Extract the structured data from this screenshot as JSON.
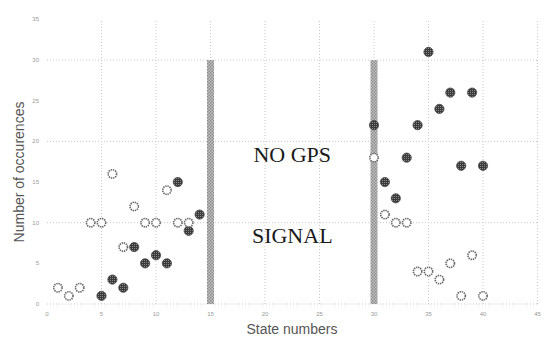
{
  "chart_data": {
    "type": "scatter",
    "title": "",
    "xlabel": "State numbers",
    "ylabel": "Number of occurences",
    "xlim": [
      0,
      45
    ],
    "ylim": [
      0,
      35
    ],
    "x_ticks": [
      0,
      5,
      10,
      15,
      20,
      25,
      30,
      35,
      40,
      45
    ],
    "y_ticks": [
      0,
      5,
      10,
      15,
      20,
      25,
      30,
      35
    ],
    "grid": true,
    "legend": null,
    "series": [
      {
        "name": "filled",
        "marker": "filled-circle",
        "color": "#555555",
        "points": [
          [
            5,
            1
          ],
          [
            6,
            3
          ],
          [
            7,
            2
          ],
          [
            8,
            7
          ],
          [
            9,
            5
          ],
          [
            10,
            6
          ],
          [
            11,
            5
          ],
          [
            12,
            15
          ],
          [
            13,
            9
          ],
          [
            14,
            11
          ],
          [
            30,
            22
          ],
          [
            31,
            15
          ],
          [
            32,
            13
          ],
          [
            33,
            18
          ],
          [
            34,
            22
          ],
          [
            35,
            31
          ],
          [
            36,
            24
          ],
          [
            37,
            26
          ],
          [
            38,
            17
          ],
          [
            39,
            26
          ],
          [
            40,
            17
          ]
        ]
      },
      {
        "name": "hollow",
        "marker": "open-circle",
        "color": "#666666",
        "points": [
          [
            1,
            2
          ],
          [
            2,
            1
          ],
          [
            3,
            2
          ],
          [
            4,
            10
          ],
          [
            5,
            10
          ],
          [
            6,
            16
          ],
          [
            7,
            7
          ],
          [
            8,
            12
          ],
          [
            9,
            10
          ],
          [
            10,
            10
          ],
          [
            11,
            14
          ],
          [
            12,
            10
          ],
          [
            13,
            10
          ],
          [
            30,
            18
          ],
          [
            31,
            11
          ],
          [
            32,
            10
          ],
          [
            33,
            10
          ],
          [
            34,
            4
          ],
          [
            35,
            4
          ],
          [
            36,
            3
          ],
          [
            37,
            5
          ],
          [
            38,
            1
          ],
          [
            39,
            6
          ],
          [
            40,
            1
          ]
        ]
      }
    ],
    "vertical_bars": [
      {
        "x": 15,
        "y_from": 0,
        "y_to": 30,
        "color": "#9a9a9a"
      },
      {
        "x": 30,
        "y_from": 0,
        "y_to": 30,
        "color": "#9a9a9a"
      }
    ],
    "annotations": [
      {
        "text": "NO GPS",
        "x": 22.5,
        "y": 18.5
      },
      {
        "text": "SIGNAL",
        "x": 22.5,
        "y": 8.5
      }
    ]
  }
}
